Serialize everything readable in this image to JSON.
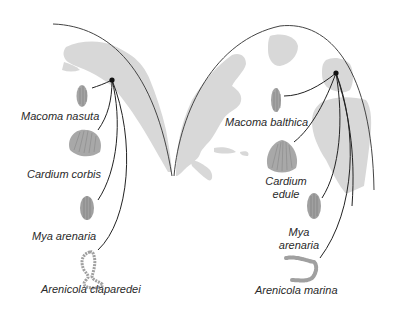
{
  "colors": {
    "land": "#d6d6d6",
    "outline": "#444444",
    "organism": "#9a9a9a",
    "text": "#2a2a2a"
  },
  "pacific": {
    "region": "North Pacific (west coast of North America)",
    "species": [
      {
        "name": "Macoma nasuta",
        "organism": "clam-elongate"
      },
      {
        "name": "Cardium corbis",
        "organism": "cockle-shell"
      },
      {
        "name": "Mya arenaria",
        "organism": "clam-oval"
      },
      {
        "name": "Arenicola claparedei",
        "organism": "lugworm"
      }
    ]
  },
  "atlantic": {
    "region": "North Atlantic (Europe)",
    "species": [
      {
        "name": "Macoma balthica",
        "organism": "clam-elongate"
      },
      {
        "name": "Cardium edule",
        "name_lines": [
          "Cardium",
          "edule"
        ],
        "organism": "cockle-shell"
      },
      {
        "name": "Mya arenaria",
        "name_lines": [
          "Mya",
          "arenaria"
        ],
        "organism": "clam-oval"
      },
      {
        "name": "Arenicola marina",
        "organism": "lugworm"
      }
    ]
  }
}
